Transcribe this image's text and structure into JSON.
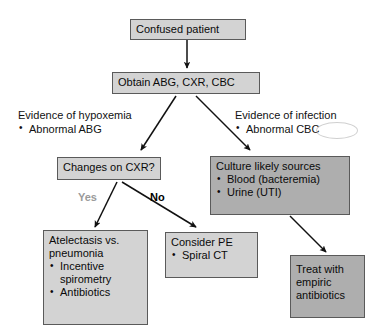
{
  "diagram": {
    "colors": {
      "box_light_fill": "#d3d3d3",
      "box_dark_fill": "#aeaeae",
      "box_border": "#5a5a5a",
      "text": "#0a0a0a",
      "label_yes": "#9a9a9a",
      "label_no": "#000000",
      "background": "#ffffff"
    },
    "nodes": {
      "confused_patient": {
        "title": "Confused patient"
      },
      "obtain_tests": {
        "title": "Obtain ABG, CXR, CBC"
      },
      "changes_cxr": {
        "title": "Changes on CXR?"
      },
      "culture_sources": {
        "title": "Culture likely sources",
        "bullets": [
          "Blood (bacteremia)",
          "Urine (UTI)"
        ]
      },
      "atelectasis": {
        "title": "Atelectasis vs.",
        "title2": "pneumonia",
        "bullets": [
          "Incentive",
          "Antibiotics"
        ],
        "bullet_cont": "spirometry"
      },
      "consider_pe": {
        "title": "Consider PE",
        "bullets": [
          "Spiral CT"
        ]
      },
      "treat_empiric": {
        "line1": "Treat with",
        "line2": "empiric",
        "line3": "antibiotics"
      }
    },
    "notes": {
      "hypoxemia": {
        "head": "Evidence of hypoxemia",
        "bullets": [
          "Abnormal ABG"
        ]
      },
      "infection": {
        "head": "Evidence of infection",
        "bullets": [
          "Abnormal CBC"
        ]
      }
    },
    "edge_labels": {
      "yes": "Yes",
      "no": "No"
    }
  }
}
